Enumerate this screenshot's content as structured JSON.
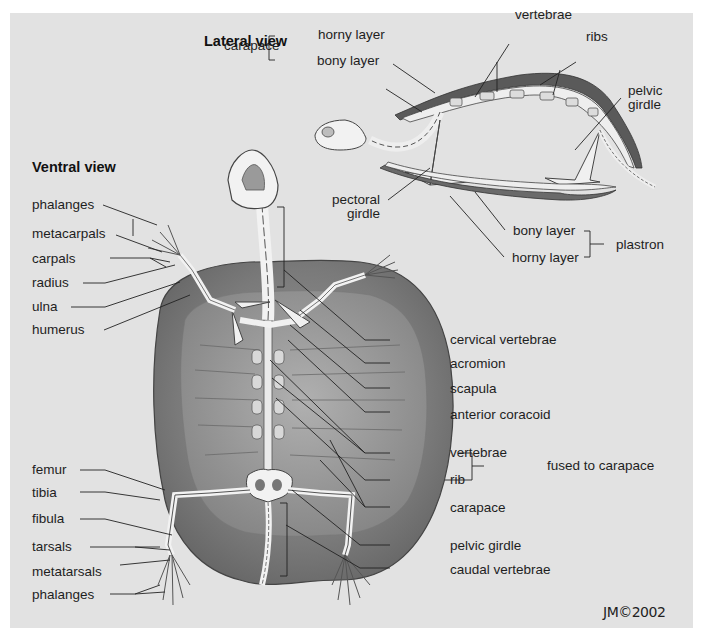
{
  "figure": {
    "colors": {
      "background": "#ffffff",
      "panel": "#e2e2e2",
      "shell_dark": "#6e6e6e",
      "shell_mid": "#8a8a8a",
      "bone": "#f2f2f2",
      "line": "#2a2a2a"
    },
    "signature": "JM©2002"
  },
  "lateral_view": {
    "title": "Lateral view",
    "carapace": {
      "label": "carapace",
      "parts": [
        "horny layer",
        "bony layer"
      ]
    },
    "labels": {
      "vertebrae": "vertebrae",
      "ribs": "ribs",
      "pelvic_girdle": "pelvic girdle",
      "pectoral_girdle": "pectoral girdle"
    },
    "plastron": {
      "label": "plastron",
      "parts": [
        "bony layer",
        "horny layer"
      ]
    }
  },
  "ventral_view": {
    "title": "Ventral view",
    "left_labels_fore": [
      "phalanges",
      "metacarpals",
      "carpals",
      "radius",
      "ulna",
      "humerus"
    ],
    "left_labels_hind": [
      "femur",
      "tibia",
      "fibula",
      "tarsals",
      "metatarsals",
      "phalanges"
    ],
    "right_labels": [
      "cervical vertebrae",
      "acromion",
      "scapula",
      "anterior coracoid",
      "vertebrae",
      "rib",
      "carapace",
      "pelvic girdle",
      "caudal vertebrae"
    ],
    "fused_group": {
      "label": "fused to carapace",
      "members": [
        "vertebrae",
        "rib"
      ]
    }
  }
}
